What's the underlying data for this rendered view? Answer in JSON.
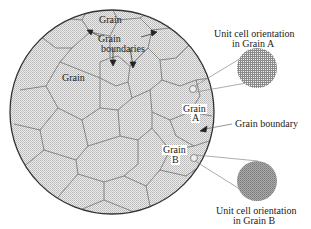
{
  "diagram": {
    "type": "polycrystalline microstructure",
    "labels": {
      "grain_top": "Grain",
      "grain_boundaries_line1": "Grain",
      "grain_boundaries_line2": "boundaries",
      "grain_left": "Grain",
      "grain_a_line1": "Grain",
      "grain_a_line2": "A",
      "grain_boundary": "Grain boundary",
      "grain_b_line1": "Grain",
      "grain_b_line2": "B",
      "unit_cell_a_line1": "Unit cell orientation",
      "unit_cell_a_line2": "in Grain A",
      "unit_cell_b_line1": "Unit cell orientation",
      "unit_cell_b_line2": "in Grain B"
    },
    "colors": {
      "fill": "#d9d9d9",
      "outline": "#333333",
      "boundary": "#777777",
      "text": "#222222"
    }
  }
}
